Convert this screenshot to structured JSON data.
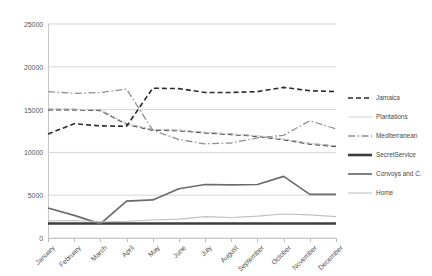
{
  "chart_data": {
    "type": "line",
    "title": "",
    "subtitle": "",
    "xlabel": "",
    "ylabel": "",
    "grid": "horizontal",
    "legend_position": "right",
    "ylim": [
      0,
      25000
    ],
    "ytick_labels": [
      "25000",
      "20000",
      "15000",
      "10000",
      "5000",
      "0"
    ],
    "ytick_values": [
      25000,
      20000,
      15000,
      10000,
      5000,
      0
    ],
    "categories": [
      "January",
      "February",
      "March",
      "April",
      "May",
      "June",
      "July",
      "August",
      "September",
      "October",
      "November",
      "December"
    ],
    "series": [
      {
        "name": "Jamaica",
        "style": "dashed",
        "color": "#2b2b2b",
        "width": 1.6,
        "values": [
          15000,
          15000,
          14900,
          13300,
          12600,
          12550,
          12300,
          12100,
          11900,
          11500,
          11000,
          10700
        ]
      },
      {
        "name": "Plantations",
        "style": "solid",
        "color": "#d2d2d2",
        "width": 1.0,
        "values": [
          15050,
          15050,
          14950,
          13350,
          12650,
          12600,
          12350,
          12150,
          11950,
          11550,
          11050,
          10750
        ]
      },
      {
        "name": "Mediterranean",
        "style": "dashdot",
        "color": "#8f8f8f",
        "width": 1.3,
        "values": [
          17100,
          16900,
          17000,
          17400,
          12600,
          11500,
          11000,
          11100,
          11700,
          12000,
          13700,
          12750
        ]
      },
      {
        "name": "SecretService",
        "style": "solid",
        "color": "#3d3d3d",
        "width": 2.6,
        "values": [
          1700,
          1700,
          1700,
          1700,
          1700,
          1700,
          1700,
          1700,
          1700,
          1700,
          1700,
          1700
        ]
      },
      {
        "name": "Convoys and C.",
        "style": "solid",
        "color": "#6b6b6b",
        "width": 1.7,
        "values": [
          3500,
          2650,
          1650,
          4300,
          4450,
          5750,
          6250,
          6200,
          6250,
          7200,
          5100,
          5100
        ]
      },
      {
        "name": "Home",
        "style": "solid",
        "color": "#c0c0c0",
        "width": 1.1,
        "values": [
          2000,
          2050,
          1900,
          1950,
          2100,
          2200,
          2500,
          2400,
          2550,
          2800,
          2700,
          2500
        ]
      },
      {
        "name": "Mediterranean2",
        "style": "dashed",
        "color": "#2b2b2b",
        "width": 1.6,
        "values": [
          12150,
          13350,
          13100,
          13050,
          17500,
          17450,
          17000,
          17000,
          17100,
          17600,
          17200,
          17100
        ]
      }
    ]
  },
  "legend": {
    "items": [
      {
        "label": "Jamaica"
      },
      {
        "label": "Plantations"
      },
      {
        "label": "Mediterranean"
      },
      {
        "label": "SecretService"
      },
      {
        "label": "Convoys and C."
      },
      {
        "label": "Home"
      }
    ]
  }
}
